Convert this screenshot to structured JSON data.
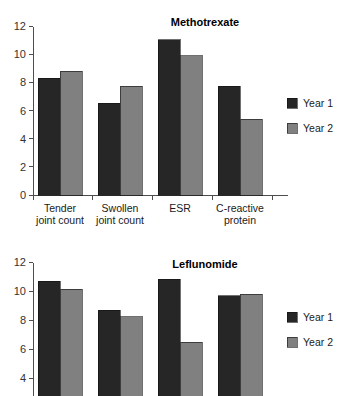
{
  "figure": {
    "background_color": "#ffffff",
    "series_colors": {
      "year1": "#262626",
      "year2": "#808080"
    },
    "axis_color": "#4d4d4d"
  },
  "chart_data": [
    {
      "type": "bar",
      "title": "Methotrexate",
      "xlabel": "",
      "ylabel": "",
      "ylim": [
        0,
        12
      ],
      "yticks": [
        0,
        2,
        4,
        6,
        8,
        10,
        12
      ],
      "ytick_labels": [
        "0",
        "2",
        "4",
        "6",
        "8",
        "10",
        "12"
      ],
      "grid": false,
      "legend_position": "right",
      "categories": [
        "Tender\njoint count",
        "Swollen\njoint count",
        "ESR",
        "C-reactive\nprotein"
      ],
      "category_lines": [
        [
          "Tender",
          "joint count"
        ],
        [
          "Swollen",
          "joint count"
        ],
        [
          "ESR",
          ""
        ],
        [
          "C-reactive",
          "protein"
        ]
      ],
      "series": [
        {
          "name": "Year 1",
          "color": "#262626",
          "values": [
            8.3,
            6.55,
            11.05,
            7.75
          ]
        },
        {
          "name": "Year 2",
          "color": "#808080",
          "values": [
            8.8,
            7.75,
            9.9,
            5.4
          ]
        }
      ]
    },
    {
      "type": "bar",
      "title": "Leflunomide",
      "xlabel": "",
      "ylabel": "",
      "ylim": [
        0,
        12
      ],
      "yticks": [
        4,
        6,
        8,
        10,
        12
      ],
      "ytick_labels": [
        "4",
        "6",
        "8",
        "10",
        "12"
      ],
      "grid": false,
      "legend_position": "right",
      "categories": [
        "Tender\njoint count",
        "Swollen\njoint count",
        "ESR",
        "C-reactive\nprotein"
      ],
      "category_lines": [
        [
          "Tender",
          "joint count"
        ],
        [
          "Swollen",
          "joint count"
        ],
        [
          "ESR",
          ""
        ],
        [
          "C-reactive",
          "protein"
        ]
      ],
      "series": [
        {
          "name": "Year 1",
          "color": "#262626",
          "values": [
            10.7,
            8.7,
            10.85,
            9.7
          ]
        },
        {
          "name": "Year 2",
          "color": "#808080",
          "values": [
            10.15,
            8.25,
            6.5,
            9.8
          ]
        }
      ],
      "clipped_at_bottom": true
    }
  ],
  "legend": {
    "entries": [
      {
        "label": "Year 1",
        "color": "#262626"
      },
      {
        "label": "Year 2",
        "color": "#808080"
      }
    ]
  }
}
